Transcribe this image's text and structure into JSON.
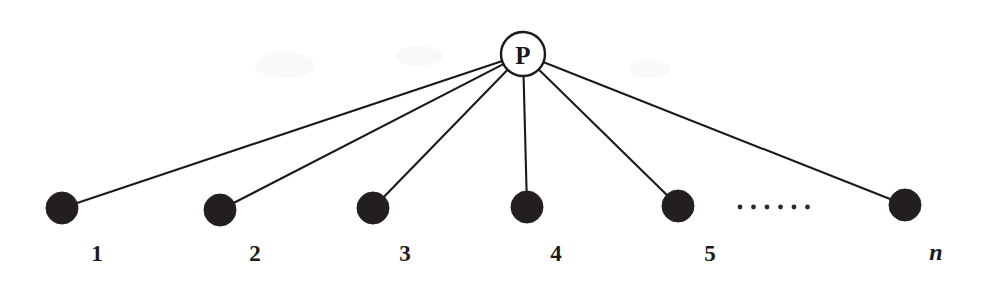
{
  "diagram": {
    "type": "star-graph",
    "canvas": {
      "width": 986,
      "height": 291,
      "background": "#ffffff"
    },
    "colors": {
      "ink": "#1a1a1a",
      "node_fill": "#231f20",
      "hub_fill": "#ffffff",
      "edge": "#1a1a1a",
      "label": "#1b1b1b"
    },
    "hub": {
      "label": "P",
      "name": "hub-node-p",
      "cx": 523,
      "cy": 54,
      "r": 22
    },
    "leaves": [
      {
        "label": "1",
        "name": "leaf-node-1",
        "cx": 62,
        "cy": 208,
        "r": 16,
        "label_x": 97,
        "label_y": 253,
        "italic": false
      },
      {
        "label": "2",
        "name": "leaf-node-2",
        "cx": 220,
        "cy": 210,
        "r": 16,
        "label_x": 255,
        "label_y": 253,
        "italic": false
      },
      {
        "label": "3",
        "name": "leaf-node-3",
        "cx": 373,
        "cy": 208,
        "r": 16,
        "label_x": 405,
        "label_y": 253,
        "italic": false
      },
      {
        "label": "4",
        "name": "leaf-node-4",
        "cx": 527,
        "cy": 207,
        "r": 16,
        "label_x": 556,
        "label_y": 253,
        "italic": false
      },
      {
        "label": "5",
        "name": "leaf-node-5",
        "cx": 678,
        "cy": 206,
        "r": 16,
        "label_x": 710,
        "label_y": 253,
        "italic": false
      },
      {
        "label": "n",
        "name": "leaf-node-n",
        "cx": 905,
        "cy": 205,
        "r": 16,
        "label_x": 936,
        "label_y": 252,
        "italic": true
      }
    ],
    "edges": [
      {
        "name": "edge-p-to-1",
        "from": "P",
        "to": "1"
      },
      {
        "name": "edge-p-to-2",
        "from": "P",
        "to": "2"
      },
      {
        "name": "edge-p-to-3",
        "from": "P",
        "to": "3"
      },
      {
        "name": "edge-p-to-4",
        "from": "P",
        "to": "4"
      },
      {
        "name": "edge-p-to-5",
        "from": "P",
        "to": "5"
      },
      {
        "name": "edge-p-to-n",
        "from": "P",
        "to": "n"
      }
    ],
    "ellipsis": {
      "name": "ellipsis-dots",
      "text": "......",
      "dot_count": 6,
      "start_x": 740,
      "spacing": 13.5,
      "y": 207,
      "r": 2.4
    }
  }
}
